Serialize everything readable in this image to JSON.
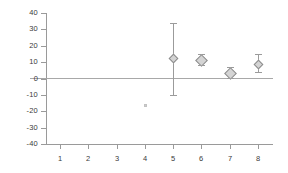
{
  "chart_data": {
    "type": "scatter",
    "title": "",
    "subtitle": "",
    "xlabel": "",
    "ylabel": "",
    "categories": [
      "1",
      "2",
      "3",
      "4",
      "5",
      "6",
      "7",
      "8"
    ],
    "xlim": [
      0.5,
      8.5
    ],
    "ylim": [
      -40,
      40
    ],
    "ytick_labels": [
      "40",
      "30",
      "20",
      "10",
      "0",
      "-10",
      "-20",
      "-30",
      "-40"
    ],
    "ytick_values": [
      40,
      30,
      20,
      10,
      0,
      -10,
      -20,
      -30,
      -40
    ],
    "xtick_labels": [
      "1",
      "2",
      "3",
      "4",
      "5",
      "6",
      "7",
      "8"
    ],
    "grid": false,
    "legend": "none",
    "zero_reference_line": 0,
    "marker_style": "diamond",
    "marker_fill": "#d4d4d4",
    "marker_edge": "#8d8d8d",
    "errorbar_color": "#9b9b9b",
    "axis_color": "#9a9a9a",
    "text_color": "#3a3a3a",
    "series": [
      {
        "name": "estimate",
        "x": [
          1,
          2,
          3,
          4,
          5,
          6,
          7,
          8
        ],
        "values": [
          null,
          null,
          null,
          -16,
          12.5,
          11.5,
          3.5,
          9
        ],
        "ci_low": [
          null,
          null,
          null,
          null,
          -10,
          8,
          0.5,
          4
        ],
        "ci_high": [
          null,
          null,
          null,
          null,
          34,
          15,
          7,
          15
        ]
      }
    ],
    "points": [
      {
        "category": "4",
        "value": -16,
        "ci_low": null,
        "ci_high": null,
        "marker": "faint-dot"
      },
      {
        "category": "5",
        "value": 12.5,
        "ci_low": -10,
        "ci_high": 34,
        "marker": "diamond-small"
      },
      {
        "category": "6",
        "value": 11.5,
        "ci_low": 8,
        "ci_high": 15,
        "marker": "diamond"
      },
      {
        "category": "7",
        "value": 3.5,
        "ci_low": 0.5,
        "ci_high": 7,
        "marker": "diamond"
      },
      {
        "category": "8",
        "value": 9,
        "ci_low": 4,
        "ci_high": 15,
        "marker": "diamond-small"
      }
    ]
  }
}
